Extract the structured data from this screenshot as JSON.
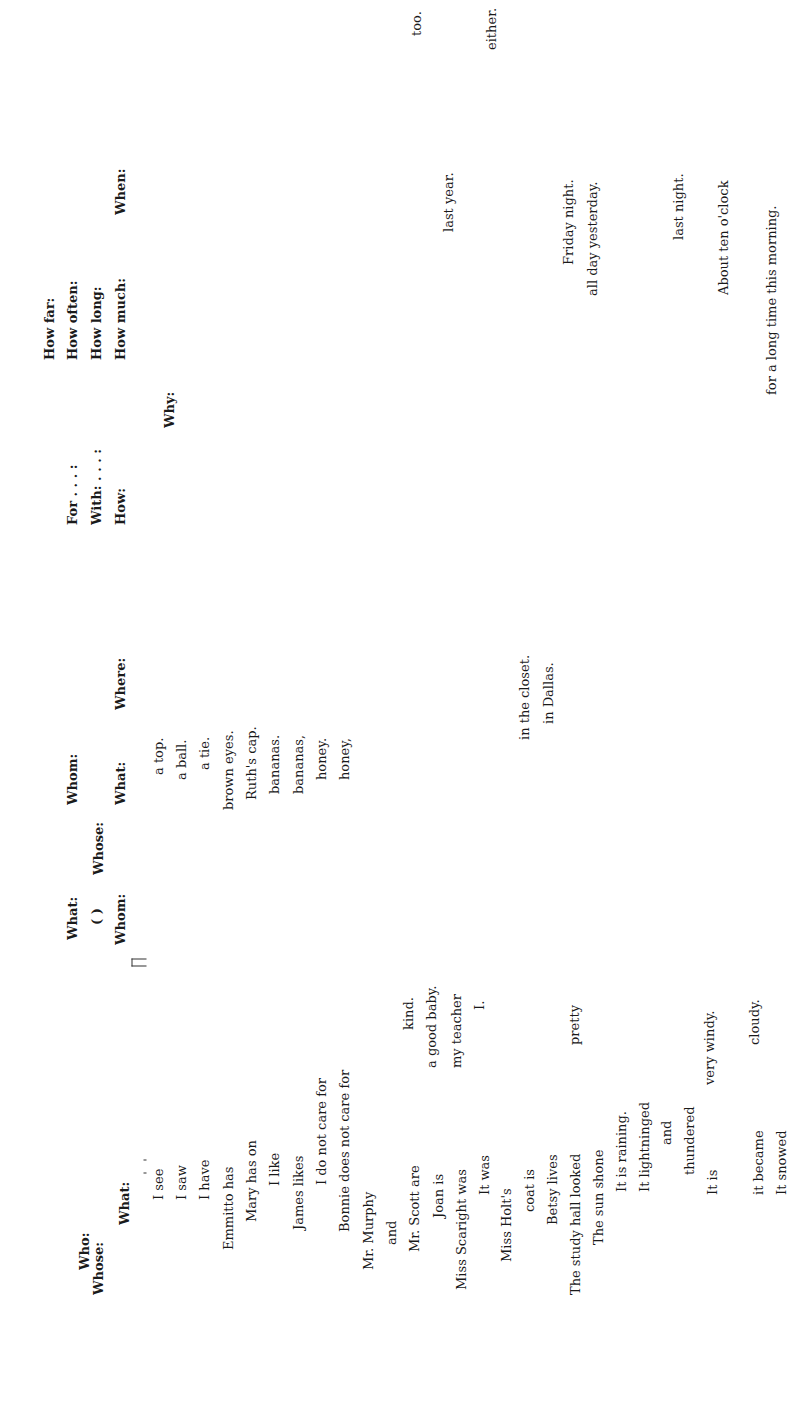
{
  "headers": {
    "who": "Who:",
    "whose": "Whose:",
    "what": "What:",
    "what2": "What:",
    "paren": "( )",
    "whom": "Whom:",
    "whose2": "Whose:",
    "whom2": "Whom:",
    "what3": "What:",
    "where": "Where:",
    "for": "For . . . :",
    "with": "With: . . . :",
    "how": "How:",
    "why": "Why:",
    "how_far": "How far:",
    "how_often": "How often:",
    "how_long": "How long:",
    "how_much": "How much:",
    "when": "When:"
  },
  "subjects": [
    "I see",
    "I saw",
    "I have",
    "Emmitto has",
    "Mary has on",
    "I like",
    "James likes",
    "I do not care for",
    "Bonnie does not care for",
    "Mr. Murphy",
    "and",
    "Mr. Scott are",
    "Joan is",
    "Miss Scaright was",
    "It was",
    "Miss Holt's",
    "coat is",
    "Betsy lives",
    "The study hall looked",
    "The sun shone",
    "It is raining.",
    "It lightninged",
    "and",
    "thundered",
    "It is",
    "it became",
    "It snowed"
  ],
  "complements": {
    "kind": "kind.",
    "good_baby": "a good baby.",
    "my_teacher": "my teacher",
    "i": "I.",
    "pretty": "pretty",
    "very_windy": "very windy.",
    "cloudy": "cloudy."
  },
  "objects": [
    "a top.",
    "a ball.",
    "a tie.",
    "brown eyes.",
    "Ruth's cap.",
    "bananas.",
    "bananas,",
    "honey.",
    "honey,"
  ],
  "places": [
    "in the closet.",
    "in Dallas."
  ],
  "times": {
    "last_year": "last year.",
    "friday": "Friday night.",
    "all_day": "all day yesterday.",
    "last_night": "last night.",
    "ten": "About ten o'clock",
    "long_time": "for a long time this morning."
  },
  "adverbs": {
    "too": "too.",
    "either": "either."
  }
}
